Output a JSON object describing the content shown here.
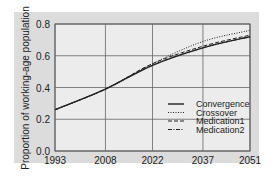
{
  "chart_data": {
    "type": "line",
    "title": "",
    "xlabel": "",
    "ylabel": "Proportion of working-age population",
    "x": [
      1993,
      2008,
      2022,
      2037,
      2051
    ],
    "xticks": [
      "1993",
      "2008",
      "2022",
      "2037",
      "2051"
    ],
    "yticks": [
      "0.0",
      "0.2",
      "0.4",
      "0.6",
      "0.8"
    ],
    "xlim": [
      1993,
      2051
    ],
    "ylim": [
      0.0,
      0.8
    ],
    "grid": true,
    "legend_position": "lower right",
    "series": [
      {
        "name": "Convergence",
        "style": "solid",
        "values": [
          0.26,
          0.39,
          0.54,
          0.65,
          0.72
        ]
      },
      {
        "name": "Crossover",
        "style": "dotted",
        "values": [
          0.26,
          0.39,
          0.55,
          0.69,
          0.76
        ]
      },
      {
        "name": "Medication1",
        "style": "dashed",
        "values": [
          0.26,
          0.39,
          0.55,
          0.66,
          0.73
        ]
      },
      {
        "name": "Medication2",
        "style": "dashdot",
        "values": [
          0.26,
          0.39,
          0.54,
          0.65,
          0.72
        ]
      }
    ]
  },
  "legend": {
    "items": [
      "Convergence",
      "Crossover",
      "Medication1",
      "Medication2"
    ]
  }
}
